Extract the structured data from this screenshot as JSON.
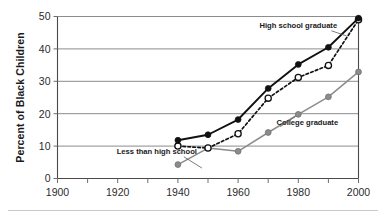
{
  "chart_data": {
    "type": "line",
    "title": "",
    "xlabel": "",
    "ylabel": "Percent of Black Children",
    "xlim": [
      1900,
      2000
    ],
    "ylim": [
      0,
      50
    ],
    "grid": true,
    "legend_position": "inline-annotations",
    "x_ticks": [
      "1900",
      "1920",
      "1940",
      "1960",
      "1980",
      "2000"
    ],
    "x_tick_values": [
      1900,
      1920,
      1940,
      1960,
      1980,
      2000
    ],
    "x_minor_tick_values": [
      1910,
      1930,
      1950,
      1970,
      1990
    ],
    "y_ticks": [
      "0",
      "10",
      "20",
      "30",
      "40",
      "50"
    ],
    "y_tick_values": [
      0,
      10,
      20,
      30,
      40,
      50
    ],
    "x": [
      1940,
      1950,
      1960,
      1970,
      1980,
      1990,
      2000
    ],
    "series": [
      {
        "name": "High school graduate",
        "style": "solid",
        "color": "#111111",
        "marker": "filled-circle",
        "values": [
          11.8,
          13.5,
          18.2,
          27.8,
          35.2,
          40.5,
          49.5
        ]
      },
      {
        "name": "Less than high school",
        "style": "dashed",
        "color": "#111111",
        "marker": "open-circle",
        "values": [
          10.0,
          9.4,
          13.8,
          24.8,
          31.2,
          34.9,
          49.0
        ]
      },
      {
        "name": "College graduate",
        "style": "solid",
        "color": "#8c8c8c",
        "marker": "filled-circle-gray",
        "values": [
          4.3,
          9.4,
          8.4,
          14.2,
          19.8,
          25.2,
          32.9
        ]
      }
    ],
    "annotations": [
      {
        "label": "High school graduate",
        "x": 1980,
        "y": 46.5
      },
      {
        "label": "Less than high school",
        "x": 1933,
        "y": 7.6
      },
      {
        "label": "College graduate",
        "x": 1983,
        "y": 16.5
      }
    ]
  },
  "colors": {
    "series_dark": "#111111",
    "series_gray": "#8c8c8c",
    "gridline": "#8c8c8c",
    "axis": "#4a4a4a",
    "text": "#1a1a1a",
    "background": "#ffffff"
  }
}
